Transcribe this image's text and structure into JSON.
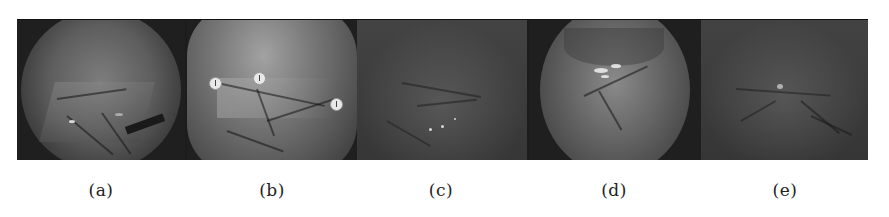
{
  "figure": {
    "panels": [
      {
        "id": "a",
        "caption": "(a)",
        "center_x": 101
      },
      {
        "id": "b",
        "caption": "(b)",
        "center_x": 272
      },
      {
        "id": "c",
        "caption": "(c)",
        "center_x": 441
      },
      {
        "id": "d",
        "caption": "(d)",
        "center_x": 614
      },
      {
        "id": "e",
        "caption": "(e)",
        "center_x": 785
      }
    ]
  }
}
